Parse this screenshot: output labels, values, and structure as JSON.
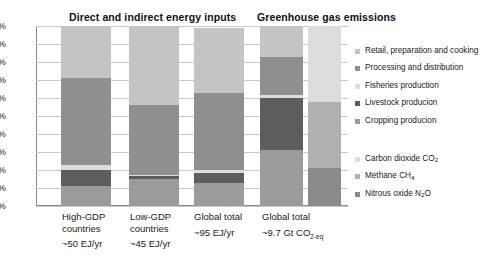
{
  "chart_data": {
    "type": "bar",
    "subtype": "stacked-percentage-column",
    "ylabel": "",
    "xlabel": "",
    "ylim": [
      0,
      100
    ],
    "grid": true,
    "y_ticks": [
      "0%",
      "10%",
      "20%",
      "30%",
      "40%",
      "50%",
      "60%",
      "70%",
      "80%",
      "90%",
      "100%"
    ],
    "y_tick_values": [
      0,
      10,
      20,
      30,
      40,
      50,
      60,
      70,
      80,
      90,
      100
    ],
    "legend_position": "right",
    "panels": [
      {
        "title": "Direct and indirect energy inputs",
        "categories": [
          "High-GDP countries",
          "Low-GDP countries",
          "Global total"
        ],
        "category_values": [
          "~50 EJ/yr",
          "~45 EJ/yr",
          "~95 EJ/yr"
        ],
        "series": [
          {
            "name": "Cropping producion",
            "values": [
              11,
              15,
              13
            ]
          },
          {
            "name": "Livestock producion",
            "values": [
              9,
              2,
              5.5
            ]
          },
          {
            "name": "Fisheries production",
            "values": [
              3,
              0.5,
              1.5
            ]
          },
          {
            "name": "Processing and distribution",
            "values": [
              48,
              38.5,
              43
            ]
          },
          {
            "name": "Retail, preparation and cooking",
            "values": [
              29,
              44,
              36
            ]
          }
        ]
      },
      {
        "title": "Greenhouse gas emissions",
        "categories": [
          "Global total"
        ],
        "category_values": [
          "~9.7 Gt CO2-eq"
        ],
        "series": [
          {
            "name": "Cropping producion",
            "values": [
              31
            ]
          },
          {
            "name": "Livestock producion",
            "values": [
              29
            ]
          },
          {
            "name": "Fisheries production",
            "values": [
              1.5
            ]
          },
          {
            "name": "Processing and distribution",
            "values": [
              21.5
            ]
          },
          {
            "name": "Retail, preparation and cooking",
            "values": [
              17
            ]
          }
        ],
        "gas_series": [
          {
            "name": "Nitrous oxide N2O",
            "values": [
              21
            ]
          },
          {
            "name": "Methane CH4",
            "values": [
              37
            ]
          },
          {
            "name": "Carbon dioxide CO2",
            "values": [
              42
            ]
          }
        ]
      }
    ],
    "colors": {
      "cropping": "#9b9b9b",
      "livestock": "#5d5d5d",
      "fisheries": "#dcdcdc",
      "processing": "#8f8f8f",
      "retail": "#c4c4c4"
    }
  },
  "titles": {
    "energy": "Direct and indirect energy inputs",
    "ghg": "Greenhouse gas emissions"
  },
  "yaxis": {
    "ticks": [
      "100%",
      "90%",
      "80%",
      "70%",
      "60%",
      "50%",
      "40%",
      "30%",
      "20%",
      "10%",
      "0%"
    ]
  },
  "xaxis": {
    "bars": [
      {
        "line1": "High-GDP",
        "line2": "countries",
        "value": "~50 EJ/yr"
      },
      {
        "line1": "Low-GDP",
        "line2": "countries",
        "value": "~45 EJ/yr"
      },
      {
        "line1": "Global total",
        "line2": "",
        "value": "~95 EJ/yr"
      },
      {
        "line1": "Global total",
        "line2": "",
        "value": "~9.7  Gt  CO",
        "value_sub": "2-eq"
      }
    ]
  },
  "legend_sector": {
    "items": [
      {
        "label": "Retail, preparation and cooking",
        "color": "#c4c4c4"
      },
      {
        "label": "Processing and distribution",
        "color": "#8f8f8f"
      },
      {
        "label": "Fisheries production",
        "color": "#dcdcdc"
      },
      {
        "label": "Livestock producion",
        "color": "#5d5d5d"
      },
      {
        "label": "Cropping producion",
        "color": "#9b9b9b"
      }
    ]
  },
  "legend_gas": {
    "items": [
      {
        "label_main": "Carbon dioxide CO",
        "label_sub": "2",
        "color": "#dcdcdc"
      },
      {
        "label_main": "Methane CH",
        "label_sub": "4",
        "color": "#b0b0b0"
      },
      {
        "label_main": "Nitrous oxide N",
        "label_sub": "2",
        "label_tail": "O",
        "color": "#8a8a8a"
      }
    ]
  }
}
